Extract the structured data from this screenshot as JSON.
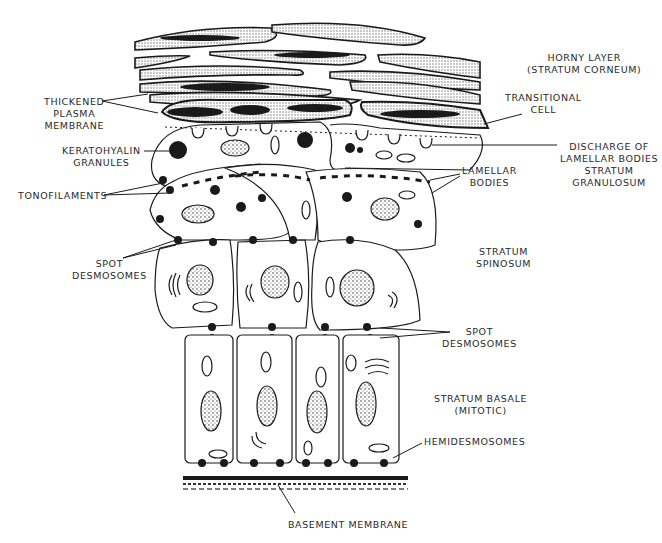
{
  "diagram": {
    "labels": {
      "horny_layer": [
        "HORNY LAYER",
        "(STRATUM CORNEUM)"
      ],
      "thickened_membrane": [
        "THICKENED",
        "PLASMA",
        "MEMBRANE"
      ],
      "transitional_cell": [
        "TRANSITIONAL",
        "CELL"
      ],
      "keratohyalin": [
        "KERATOHYALIN",
        "GRANULES"
      ],
      "discharge": [
        "DISCHARGE OF",
        "LAMELLAR BODIES",
        "STRATUM",
        "GRANULOSUM"
      ],
      "lamellar_bodies": [
        "LAMELLAR",
        "BODIES"
      ],
      "tonofilaments": [
        "TONOFILAMENTS"
      ],
      "spot_desmosomes_left": [
        "SPOT",
        "DESMOSOMES"
      ],
      "stratum_spinosum": [
        "STRATUM",
        "SPINOSUM"
      ],
      "spot_desmosomes_right": [
        "SPOT",
        "DESMOSOMES"
      ],
      "stratum_basale": [
        "STRATUM BASALE",
        "(MITOTIC)"
      ],
      "hemidesmosomes": [
        "HEMIDESMOSOMES"
      ],
      "basement_membrane": [
        "BASEMENT MEMBRANE"
      ]
    },
    "colors": {
      "ink": "#1a1a1a",
      "stipple": "#cfcfcf",
      "paper": "#ffffff"
    }
  }
}
